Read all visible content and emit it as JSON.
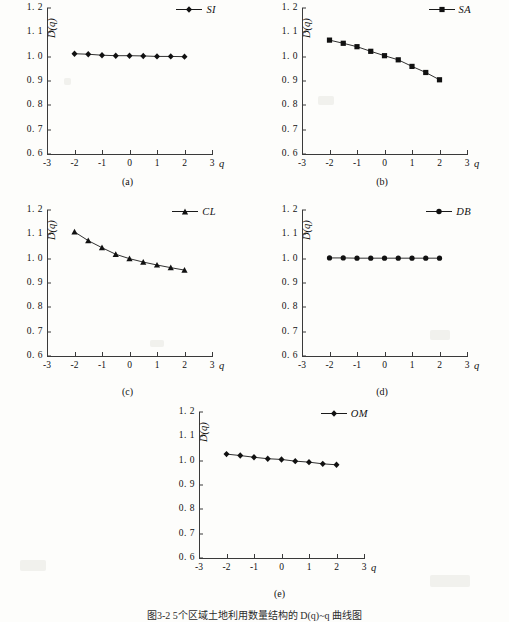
{
  "figure": {
    "caption": "图3-2 5个区域土地利用数量结构的 D(q)~q 曲线图",
    "axis": {
      "ylabel": "D(q)",
      "xlabel": "q",
      "yticks": [
        "0. 6",
        "0. 7",
        "0. 8",
        "0. 9",
        "1. 0",
        "1. 1",
        "1. 2"
      ],
      "ytick_values": [
        0.6,
        0.7,
        0.8,
        0.9,
        1.0,
        1.1,
        1.2
      ],
      "xticks": [
        "-3",
        "-2",
        "-1",
        "0",
        "1",
        "2",
        "3"
      ],
      "xtick_values": [
        -3,
        -2,
        -1,
        0,
        1,
        2,
        3
      ]
    },
    "line_color": "#1a1a1a",
    "marker_color": "#111111"
  },
  "panels": [
    {
      "key": "a",
      "caption": "(a)",
      "legend": "SI",
      "marker": "diamond-marker"
    },
    {
      "key": "b",
      "caption": "(b)",
      "legend": "SA",
      "marker": "square-marker"
    },
    {
      "key": "c",
      "caption": "(c)",
      "legend": "CL",
      "marker": "triangle-marker"
    },
    {
      "key": "d",
      "caption": "(d)",
      "legend": "DB",
      "marker": "circle-marker"
    },
    {
      "key": "e",
      "caption": "(e)",
      "legend": "OM",
      "marker": "diamond-marker"
    }
  ],
  "chart_data": [
    {
      "type": "line",
      "title": "(a)",
      "xlabel": "q",
      "ylabel": "D(q)",
      "xlim": [
        -3,
        3
      ],
      "ylim": [
        0.6,
        1.2
      ],
      "grid": false,
      "legend_position": "top-right",
      "series": [
        {
          "name": "SI",
          "marker": "diamond",
          "x": [
            -2,
            -1.5,
            -1,
            -0.5,
            0,
            0.5,
            1,
            1.5,
            2
          ],
          "values": [
            1.012,
            1.01,
            1.006,
            1.004,
            1.004,
            1.003,
            1.001,
            1.001,
            1.0
          ]
        }
      ]
    },
    {
      "type": "line",
      "title": "(b)",
      "xlabel": "q",
      "ylabel": "D(q)",
      "xlim": [
        -3,
        3
      ],
      "ylim": [
        0.6,
        1.2
      ],
      "grid": false,
      "legend_position": "top-right",
      "series": [
        {
          "name": "SA",
          "marker": "square",
          "x": [
            -2,
            -1.5,
            -1,
            -0.5,
            0,
            0.5,
            1,
            1.5,
            2
          ],
          "values": [
            1.068,
            1.055,
            1.041,
            1.022,
            1.004,
            0.987,
            0.96,
            0.935,
            0.905
          ]
        }
      ]
    },
    {
      "type": "line",
      "title": "(c)",
      "xlabel": "q",
      "ylabel": "D(q)",
      "xlim": [
        -3,
        3
      ],
      "ylim": [
        0.6,
        1.2
      ],
      "grid": false,
      "legend_position": "top-right",
      "series": [
        {
          "name": "CL",
          "marker": "triangle",
          "x": [
            -2,
            -1.5,
            -1,
            -0.5,
            0,
            0.5,
            1,
            1.5,
            2
          ],
          "values": [
            1.11,
            1.074,
            1.045,
            1.018,
            1.0,
            0.986,
            0.974,
            0.963,
            0.953
          ]
        }
      ]
    },
    {
      "type": "line",
      "title": "(d)",
      "xlabel": "q",
      "ylabel": "D(q)",
      "xlim": [
        -3,
        3
      ],
      "ylim": [
        0.6,
        1.2
      ],
      "grid": false,
      "legend_position": "top-right",
      "series": [
        {
          "name": "DB",
          "marker": "circle",
          "x": [
            -2,
            -1.5,
            -1,
            -0.5,
            0,
            0.5,
            1,
            1.5,
            2
          ],
          "values": [
            1.003,
            1.003,
            1.002,
            1.002,
            1.002,
            1.002,
            1.002,
            1.002,
            1.002
          ]
        }
      ]
    },
    {
      "type": "line",
      "title": "(e)",
      "xlabel": "q",
      "ylabel": "D(q)",
      "xlim": [
        -3,
        3
      ],
      "ylim": [
        0.6,
        1.2
      ],
      "grid": false,
      "legend_position": "top-right",
      "series": [
        {
          "name": "OM",
          "marker": "diamond",
          "x": [
            -2,
            -1.5,
            -1,
            -0.5,
            0,
            0.5,
            1,
            1.5,
            2
          ],
          "values": [
            1.027,
            1.021,
            1.014,
            1.008,
            1.005,
            0.998,
            0.994,
            0.987,
            0.983
          ]
        }
      ]
    }
  ]
}
